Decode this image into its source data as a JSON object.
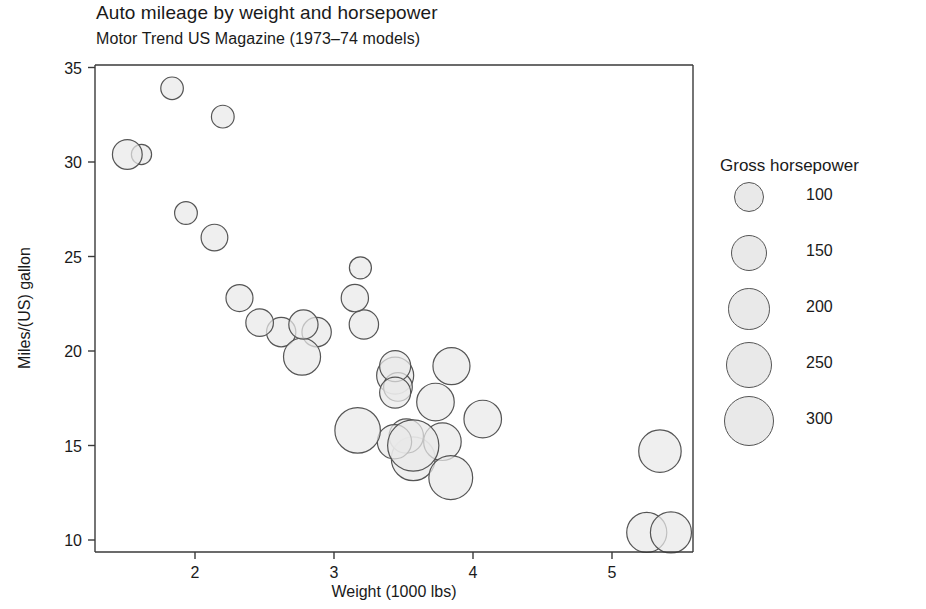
{
  "header": {
    "title": "Auto mileage by weight and horsepower",
    "subtitle": "Motor Trend US Magazine (1973–74 models)"
  },
  "legend": {
    "title": "Gross horsepower",
    "position": "right",
    "entries": [
      {
        "label": "100",
        "value": 100
      },
      {
        "label": "150",
        "value": 150
      },
      {
        "label": "200",
        "value": 200
      },
      {
        "label": "250",
        "value": 250
      },
      {
        "label": "300",
        "value": 300
      }
    ]
  },
  "style": {
    "bubble_fill": "#e9e9e9",
    "bubble_stroke": "#555555",
    "axis_color": "#3a3a3a",
    "text_color": "#1a1a1a",
    "background": "#ffffff"
  },
  "chart_data": {
    "type": "scatter",
    "title": "Auto mileage by weight and horsepower",
    "subtitle": "Motor Trend US Magazine (1973–74 models)",
    "xlabel": "Weight (1000 lbs)",
    "ylabel": "Miles/(US) gallon",
    "xlim": [
      1.3,
      5.6
    ],
    "ylim": [
      9.3,
      35.0
    ],
    "xticks": [
      2,
      3,
      4,
      5
    ],
    "yticks": [
      10,
      15,
      20,
      25,
      30,
      35
    ],
    "grid": false,
    "size_encoding": {
      "variable": "Gross horsepower",
      "legend_values": [
        100,
        150,
        200,
        250,
        300
      ]
    },
    "series": [
      {
        "name": "mtcars",
        "x_name": "wt",
        "y_name": "mpg",
        "size_name": "hp",
        "points": [
          {
            "x": 2.62,
            "y": 21.0,
            "size": 110
          },
          {
            "x": 2.875,
            "y": 21.0,
            "size": 110
          },
          {
            "x": 2.32,
            "y": 22.8,
            "size": 93
          },
          {
            "x": 3.215,
            "y": 21.4,
            "size": 110
          },
          {
            "x": 3.44,
            "y": 18.7,
            "size": 175
          },
          {
            "x": 3.46,
            "y": 18.1,
            "size": 105
          },
          {
            "x": 3.57,
            "y": 14.3,
            "size": 245
          },
          {
            "x": 3.19,
            "y": 24.4,
            "size": 62
          },
          {
            "x": 3.15,
            "y": 22.8,
            "size": 95
          },
          {
            "x": 3.44,
            "y": 19.2,
            "size": 123
          },
          {
            "x": 3.44,
            "y": 17.8,
            "size": 123
          },
          {
            "x": 4.07,
            "y": 16.4,
            "size": 180
          },
          {
            "x": 3.73,
            "y": 17.3,
            "size": 180
          },
          {
            "x": 3.78,
            "y": 15.2,
            "size": 180
          },
          {
            "x": 5.25,
            "y": 10.4,
            "size": 205
          },
          {
            "x": 5.424,
            "y": 10.4,
            "size": 215
          },
          {
            "x": 5.345,
            "y": 14.7,
            "size": 230
          },
          {
            "x": 2.2,
            "y": 32.4,
            "size": 66
          },
          {
            "x": 1.615,
            "y": 30.4,
            "size": 52
          },
          {
            "x": 1.835,
            "y": 33.9,
            "size": 65
          },
          {
            "x": 2.465,
            "y": 21.5,
            "size": 97
          },
          {
            "x": 3.52,
            "y": 15.5,
            "size": 150
          },
          {
            "x": 3.435,
            "y": 15.2,
            "size": 150
          },
          {
            "x": 3.84,
            "y": 13.3,
            "size": 245
          },
          {
            "x": 3.845,
            "y": 19.2,
            "size": 175
          },
          {
            "x": 1.935,
            "y": 27.3,
            "size": 66
          },
          {
            "x": 2.14,
            "y": 26.0,
            "size": 91
          },
          {
            "x": 1.513,
            "y": 30.4,
            "size": 113
          },
          {
            "x": 3.17,
            "y": 15.8,
            "size": 264
          },
          {
            "x": 2.77,
            "y": 19.7,
            "size": 175
          },
          {
            "x": 3.57,
            "y": 15.0,
            "size": 335
          },
          {
            "x": 2.78,
            "y": 21.4,
            "size": 109
          }
        ]
      }
    ]
  }
}
